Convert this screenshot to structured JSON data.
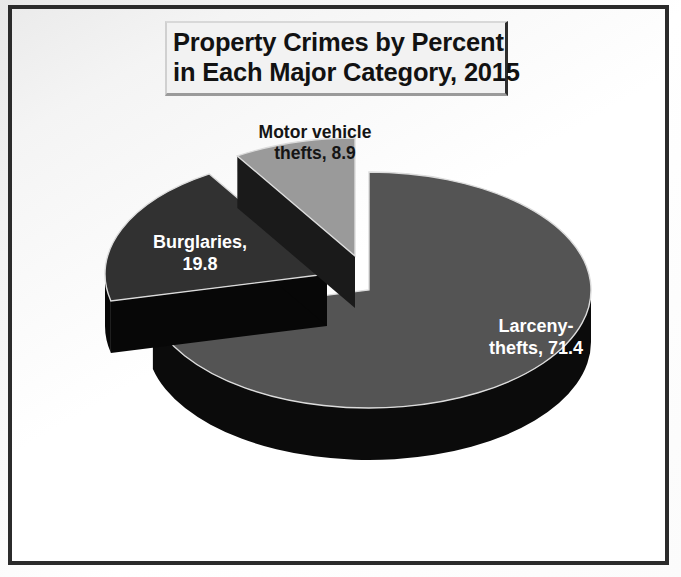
{
  "frame": {
    "border_color": "#2b2b2b",
    "background": "#ffffff"
  },
  "title": {
    "line1": "Property Crimes by Percent",
    "line2": "in Each Major Category, 2015",
    "plate_bg": "#f2f2f2",
    "text_color": "#121212"
  },
  "labels": {
    "motor_vehicle_line1": "Motor vehicle",
    "motor_vehicle_line2": "thefts, 8.9",
    "burglaries_line1": "Burglaries,",
    "burglaries_line2": "19.8",
    "larceny_line1": "Larceny-",
    "larceny_line2": "thefts, 71.4"
  },
  "chart_data": {
    "type": "pie",
    "title": "Property Crimes by Percent in Each Major Category, 2015",
    "subtitle": "",
    "xlabel": "",
    "ylabel": "",
    "grid": false,
    "legend": "none",
    "three_d": true,
    "start_angle_deg": 0,
    "direction": "clockwise",
    "value_unit": "percent",
    "total": 100.1,
    "labels": [
      "Larceny-thefts",
      "Burglaries",
      "Motor vehicle thefts"
    ],
    "values": [
      71.4,
      19.8,
      8.9
    ],
    "data_labels": [
      "Larceny-thefts, 71.4",
      "Burglaries, 19.8",
      "Motor vehicle thefts, 8.9"
    ],
    "slices": [
      {
        "name": "Larceny-thefts",
        "value": 71.4,
        "label": "Larceny-thefts, 71.4",
        "top_color": "#545454",
        "side_color": "#0b0b0b",
        "label_color": "#ffffff",
        "exploded": false
      },
      {
        "name": "Burglaries",
        "value": 19.8,
        "label": "Burglaries, 19.8",
        "top_color": "#313131",
        "side_color": "#070707",
        "label_color": "#ffffff",
        "exploded": true
      },
      {
        "name": "Motor vehicle thefts",
        "value": 8.9,
        "label": "Motor vehicle thefts, 8.9",
        "top_color": "#9a9a9a",
        "side_color": "#1a1a1a",
        "label_color": "#151515",
        "exploded": true
      }
    ]
  }
}
